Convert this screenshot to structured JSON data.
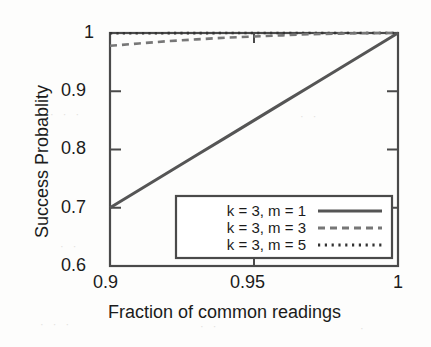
{
  "chart_data": {
    "type": "line",
    "title": "",
    "xlabel": "Fraction of common readings",
    "ylabel": "Success Probablity",
    "xlim": [
      0.9,
      1.0
    ],
    "ylim": [
      0.6,
      1.0
    ],
    "xticks": [
      "0.9",
      "0.95",
      "1"
    ],
    "xtick_values": [
      0.9,
      0.95,
      1.0
    ],
    "yticks": [
      "0.6",
      "0.7",
      "0.8",
      "0.9",
      "1"
    ],
    "ytick_values": [
      0.6,
      0.7,
      0.8,
      0.9,
      1.0
    ],
    "grid": false,
    "legend_position": "lower right",
    "x": [
      0.9,
      0.91,
      0.92,
      0.93,
      0.94,
      0.95,
      0.96,
      0.97,
      0.98,
      0.99,
      1.0
    ],
    "series": [
      {
        "name": "k = 3, m = 1",
        "style": "solid",
        "color": "#555555",
        "values": [
          0.7,
          0.73,
          0.76,
          0.79,
          0.82,
          0.85,
          0.88,
          0.91,
          0.94,
          0.97,
          1.0
        ]
      },
      {
        "name": "k = 3, m = 3",
        "style": "dashed",
        "color": "#777777",
        "values": [
          0.978,
          0.982,
          0.986,
          0.989,
          0.992,
          0.994,
          0.996,
          0.998,
          0.999,
          0.9998,
          1.0
        ]
      },
      {
        "name": "k = 3, m = 5",
        "style": "dotted",
        "color": "#333333",
        "values": [
          0.9995,
          0.9996,
          0.9997,
          0.9998,
          0.9999,
          0.9999,
          1.0,
          1.0,
          1.0,
          1.0,
          1.0
        ]
      }
    ]
  },
  "axes": {
    "ylabel": "Success Probablity",
    "xlabel": "Fraction of common readings",
    "xtick_labels": [
      "0.9",
      "0.95",
      "1"
    ],
    "ytick_labels": [
      "1",
      "0.9",
      "0.8",
      "0.7",
      "0.6"
    ]
  },
  "legend": {
    "entries": [
      {
        "label": "k = 3, m = 1",
        "style": "solid"
      },
      {
        "label": "k = 3, m = 3",
        "style": "dashed"
      },
      {
        "label": "k = 3, m = 5",
        "style": "dotted"
      }
    ]
  },
  "colors": {
    "axis": "#4a4a4a",
    "solid_series": "#555555",
    "dashed_series": "#777777",
    "dotted_series": "#333333",
    "text": "#1b1b1b",
    "background": "#fdfdfc"
  }
}
